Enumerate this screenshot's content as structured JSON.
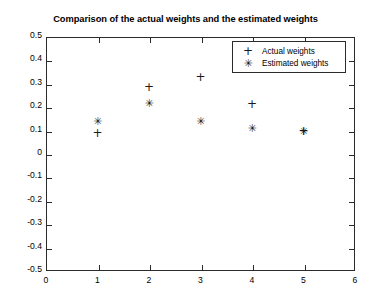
{
  "chart_data": {
    "type": "scatter",
    "title": "Comparison of the actual weights and the estimated weights",
    "xlabel": "",
    "ylabel": "",
    "xlim": [
      0,
      6
    ],
    "ylim": [
      -0.5,
      0.5
    ],
    "xticks": [
      0,
      1,
      2,
      3,
      4,
      5,
      6
    ],
    "xtick_labels": [
      "0",
      "1",
      "2",
      "3",
      "4",
      "5",
      "6"
    ],
    "yticks": [
      -0.5,
      -0.4,
      -0.3,
      -0.2,
      -0.1,
      0,
      0.1,
      0.2,
      0.3,
      0.4,
      0.5
    ],
    "ytick_labels": [
      "-0.5",
      "-0.4",
      "-0.3",
      "-0.2",
      "-0.1",
      "0",
      "0.1",
      "0.2",
      "0.3",
      "0.4",
      "0.5"
    ],
    "grid": false,
    "legend_position": "upper right",
    "x": [
      1,
      2,
      3,
      4,
      5
    ],
    "series": [
      {
        "name": "Actual weights",
        "marker": "plus",
        "glyph": "+",
        "color": "#1a1a1a",
        "values": [
          0.09,
          0.285,
          0.33,
          0.215,
          0.098
        ]
      },
      {
        "name": "Estimated weights",
        "marker": "asterisk",
        "glyph": "✳",
        "color": "#1a1a1a",
        "values": [
          0.14,
          0.22,
          0.142,
          0.112,
          0.098
        ]
      }
    ]
  },
  "legend": {
    "entries": [
      {
        "glyph": "+",
        "label": "Actual weights"
      },
      {
        "glyph": "✳",
        "label": "Estimated weights"
      }
    ]
  }
}
